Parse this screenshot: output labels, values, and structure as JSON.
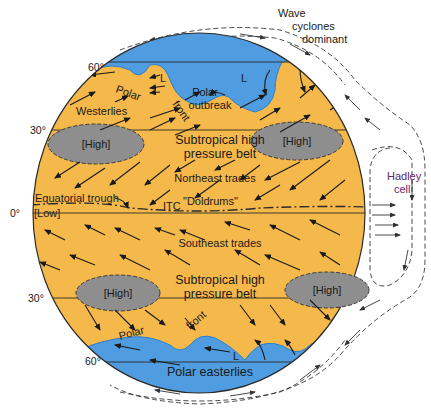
{
  "colors": {
    "tropics_fill": "#f5b84a",
    "polar_fill": "#4f9de0",
    "high_fill": "#8e8e8e",
    "outline": "#2b2b2b",
    "hadley_label": "#5a2a6a",
    "background": "#ffffff"
  },
  "latitudes": {
    "n60": "60°",
    "n30": "30°",
    "eq": "0°",
    "s30": "30°",
    "s60": "60°"
  },
  "northern": {
    "polar_outbreak_line1": "Polar",
    "polar_outbreak_line2": "outbreak",
    "low_a": "L",
    "low_b": "L",
    "polar_front_polar": "Polar",
    "polar_front_front": "front",
    "westerlies": "Westerlies",
    "high_left": "[High]",
    "high_right": "[High]",
    "subtropical_line1": "Subtropical high",
    "subtropical_line2": "pressure belt",
    "northeast_trades": "Northeast trades"
  },
  "equator": {
    "equatorial_trough": "Equatorial trough",
    "low": "[Low]",
    "itc": "ITC",
    "doldrums": "\"Doldrums\""
  },
  "southern": {
    "southeast_trades": "Southeast trades",
    "subtropical_line1": "Subtropical high",
    "subtropical_line2": "pressure belt",
    "high_left": "[High]",
    "high_right": "[High]",
    "polar_front_polar": "Polar",
    "polar_front_front": "front",
    "low": "L",
    "polar_easterlies": "Polar easterlies"
  },
  "side_labels": {
    "wave_line1": "Wave",
    "wave_line2": "cyclones",
    "wave_line3": "dominant",
    "hadley_line1": "Hadley",
    "hadley_line2": "cell"
  }
}
